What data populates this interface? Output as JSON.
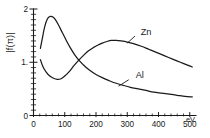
{
  "figure": {
    "background_color": "#ffffff",
    "ink_color": "#1a1a1a"
  },
  "axes": {
    "y_label": "|f(π)|",
    "x_unit_label": "eV.",
    "y_tick_labels": [
      "0",
      "1.",
      "2"
    ],
    "x_tick_labels": [
      "0",
      "100",
      "200",
      "300",
      "400",
      "500"
    ]
  },
  "labels": {
    "zn": "Zn",
    "al": "Al"
  },
  "chart_data": {
    "type": "line",
    "title": "",
    "subtitle": "",
    "xlabel": "eV.",
    "ylabel": "|f(π)|",
    "xlim": [
      0,
      520
    ],
    "ylim": [
      0,
      2
    ],
    "grid": false,
    "legend": "inline-curve-labels",
    "x_ticks": [
      0,
      100,
      200,
      300,
      400,
      500
    ],
    "y_ticks": [
      0,
      1,
      2
    ],
    "x_minor_tick_step": 20,
    "y_minor_tick_step": 0.1,
    "annotations": [
      {
        "text": "Zn",
        "x": 360,
        "y": 1.52,
        "leader_to": {
          "x": 300,
          "y": 1.36
        }
      },
      {
        "text": "Al",
        "x": 340,
        "y": 0.7,
        "leader_to": {
          "x": 272,
          "y": 0.55
        }
      }
    ],
    "series": [
      {
        "name": "Zn",
        "points": [
          [
            22,
            1.05
          ],
          [
            30,
            0.92
          ],
          [
            40,
            0.82
          ],
          [
            52,
            0.74
          ],
          [
            64,
            0.7
          ],
          [
            76,
            0.68
          ],
          [
            88,
            0.69
          ],
          [
            100,
            0.74
          ],
          [
            115,
            0.83
          ],
          [
            130,
            0.94
          ],
          [
            145,
            1.04
          ],
          [
            160,
            1.13
          ],
          [
            175,
            1.21
          ],
          [
            190,
            1.27
          ],
          [
            205,
            1.32
          ],
          [
            220,
            1.36
          ],
          [
            235,
            1.39
          ],
          [
            250,
            1.41
          ],
          [
            265,
            1.41
          ],
          [
            280,
            1.4
          ],
          [
            300,
            1.38
          ],
          [
            320,
            1.35
          ],
          [
            345,
            1.3
          ],
          [
            370,
            1.24
          ],
          [
            395,
            1.18
          ],
          [
            420,
            1.12
          ],
          [
            445,
            1.06
          ],
          [
            470,
            1.0
          ],
          [
            495,
            0.94
          ],
          [
            508,
            0.91
          ]
        ]
      },
      {
        "name": "Al",
        "points": [
          [
            22,
            1.26
          ],
          [
            28,
            1.44
          ],
          [
            34,
            1.62
          ],
          [
            40,
            1.75
          ],
          [
            46,
            1.83
          ],
          [
            54,
            1.86
          ],
          [
            62,
            1.85
          ],
          [
            70,
            1.8
          ],
          [
            80,
            1.7
          ],
          [
            92,
            1.56
          ],
          [
            105,
            1.41
          ],
          [
            118,
            1.27
          ],
          [
            132,
            1.14
          ],
          [
            148,
            1.02
          ],
          [
            165,
            0.92
          ],
          [
            182,
            0.84
          ],
          [
            200,
            0.77
          ],
          [
            220,
            0.71
          ],
          [
            240,
            0.66
          ],
          [
            262,
            0.61
          ],
          [
            285,
            0.57
          ],
          [
            310,
            0.53
          ],
          [
            335,
            0.5
          ],
          [
            360,
            0.47
          ],
          [
            385,
            0.44
          ],
          [
            410,
            0.42
          ],
          [
            435,
            0.4
          ],
          [
            460,
            0.38
          ],
          [
            485,
            0.36
          ],
          [
            508,
            0.35
          ]
        ]
      }
    ]
  }
}
